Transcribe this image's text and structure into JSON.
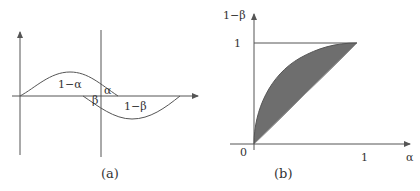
{
  "panel_a": {
    "caption": "(a)",
    "labels": {
      "one_minus_alpha": "1−α",
      "alpha": "α",
      "beta": "β",
      "one_minus_beta": "1−β"
    },
    "description": "Two overlapping density curves (null above axis, alternative below) separated by a decision threshold line"
  },
  "panel_b": {
    "caption": "(b)",
    "y_axis_label": "1−β",
    "x_axis_label": "α",
    "y_tick": "1",
    "x_tick": "1",
    "origin_label": "0",
    "description": "ROC-style curve; shaded region between concave curve and diagonal",
    "colors": {
      "fill": "#6e6e6e",
      "stroke": "#555555"
    }
  }
}
